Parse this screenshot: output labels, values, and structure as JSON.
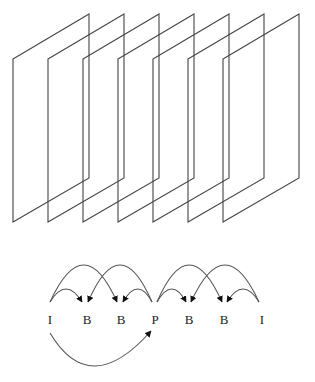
{
  "diagram": {
    "title": "",
    "frames": {
      "count": 7,
      "shape": "parallelogram",
      "first_left_x": 13,
      "spacing": 35,
      "width": 76,
      "top_left_y": 59,
      "top_right_y": 14,
      "bottom_left_y": 222,
      "bottom_right_y": 178,
      "stroke_color": "#444444"
    },
    "sequence": {
      "labels": [
        "I",
        "B",
        "B",
        "P",
        "B",
        "B",
        "I"
      ],
      "x": [
        50,
        87,
        121,
        155,
        189,
        224,
        262
      ],
      "y": 324
    },
    "references": [
      {
        "from": "I",
        "from_index": 0,
        "to": "B",
        "to_index": 1,
        "type": "forward-short"
      },
      {
        "from": "I",
        "from_index": 0,
        "to": "B",
        "to_index": 2,
        "type": "forward-long"
      },
      {
        "from": "P",
        "from_index": 3,
        "to": "B",
        "to_index": 1,
        "type": "backward-long"
      },
      {
        "from": "P",
        "from_index": 3,
        "to": "B",
        "to_index": 2,
        "type": "backward-short"
      },
      {
        "from": "P",
        "from_index": 3,
        "to": "B",
        "to_index": 4,
        "type": "forward-short"
      },
      {
        "from": "P",
        "from_index": 3,
        "to": "B",
        "to_index": 5,
        "type": "forward-long"
      },
      {
        "from": "I",
        "from_index": 6,
        "to": "B",
        "to_index": 4,
        "type": "backward-long"
      },
      {
        "from": "I",
        "from_index": 6,
        "to": "B",
        "to_index": 5,
        "type": "backward-short"
      },
      {
        "from": "I",
        "from_index": 0,
        "to": "P",
        "to_index": 3,
        "type": "forward-prediction-below"
      }
    ]
  }
}
